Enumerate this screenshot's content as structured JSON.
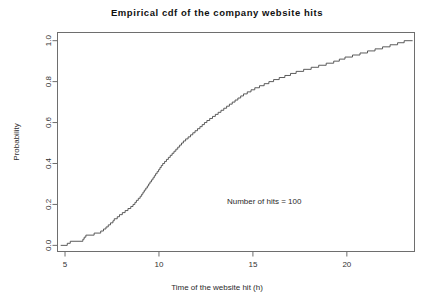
{
  "chart_data": {
    "type": "line",
    "title": "Empirical cdf of the company website hits",
    "xlabel": "Time of the website hit (h)",
    "ylabel": "Probability",
    "xlim": [
      4.6,
      23.6
    ],
    "ylim": [
      -0.03,
      1.04
    ],
    "grid": false,
    "legend": null,
    "annotations": [
      {
        "text": "Number of hits = 100",
        "x": 15.6,
        "y": 0.215
      }
    ],
    "xticks": [
      5,
      10,
      15,
      20
    ],
    "xtick_labels": [
      "5",
      "10",
      "15",
      "20"
    ],
    "yticks": [
      0.0,
      0.2,
      0.4,
      0.6,
      0.8,
      1.0
    ],
    "ytick_labels": [
      "0.0",
      "0.2",
      "0.4",
      "0.6",
      "0.8",
      "1.0"
    ],
    "series": [
      {
        "name": "Empirical CDF",
        "step": "post",
        "n": 100,
        "color": "#4a4a4a",
        "x": [
          5.12,
          5.28,
          5.95,
          6.02,
          6.11,
          6.55,
          6.9,
          7.05,
          7.18,
          7.3,
          7.42,
          7.55,
          7.62,
          7.78,
          7.9,
          8.05,
          8.2,
          8.35,
          8.5,
          8.62,
          8.72,
          8.8,
          8.9,
          9.0,
          9.08,
          9.15,
          9.22,
          9.3,
          9.38,
          9.45,
          9.52,
          9.6,
          9.68,
          9.75,
          9.82,
          9.9,
          9.98,
          10.05,
          10.12,
          10.2,
          10.3,
          10.4,
          10.5,
          10.6,
          10.7,
          10.8,
          10.9,
          11.0,
          11.1,
          11.2,
          11.3,
          11.42,
          11.55,
          11.68,
          11.8,
          11.92,
          12.05,
          12.18,
          12.3,
          12.42,
          12.55,
          12.7,
          12.85,
          13.0,
          13.15,
          13.3,
          13.45,
          13.6,
          13.75,
          13.9,
          14.05,
          14.2,
          14.35,
          14.5,
          14.7,
          14.9,
          15.1,
          15.35,
          15.6,
          15.85,
          16.1,
          16.4,
          16.7,
          17.0,
          17.3,
          17.7,
          18.1,
          18.5,
          18.9,
          19.3,
          19.6,
          19.9,
          20.3,
          20.7,
          21.1,
          21.5,
          21.9,
          22.3,
          22.7,
          23.05
        ],
        "y": [
          0.01,
          0.02,
          0.03,
          0.04,
          0.05,
          0.06,
          0.07,
          0.08,
          0.09,
          0.1,
          0.11,
          0.12,
          0.13,
          0.14,
          0.15,
          0.16,
          0.17,
          0.18,
          0.19,
          0.2,
          0.21,
          0.22,
          0.23,
          0.24,
          0.25,
          0.26,
          0.27,
          0.28,
          0.29,
          0.3,
          0.31,
          0.32,
          0.33,
          0.34,
          0.35,
          0.36,
          0.37,
          0.38,
          0.39,
          0.4,
          0.41,
          0.42,
          0.43,
          0.44,
          0.45,
          0.46,
          0.47,
          0.48,
          0.49,
          0.5,
          0.51,
          0.52,
          0.53,
          0.54,
          0.55,
          0.56,
          0.57,
          0.58,
          0.59,
          0.6,
          0.61,
          0.62,
          0.63,
          0.64,
          0.65,
          0.66,
          0.67,
          0.68,
          0.69,
          0.7,
          0.71,
          0.72,
          0.73,
          0.74,
          0.75,
          0.76,
          0.77,
          0.78,
          0.79,
          0.8,
          0.81,
          0.82,
          0.83,
          0.84,
          0.85,
          0.86,
          0.87,
          0.88,
          0.89,
          0.9,
          0.91,
          0.92,
          0.93,
          0.94,
          0.95,
          0.96,
          0.97,
          0.98,
          0.99,
          1.0
        ]
      }
    ]
  }
}
